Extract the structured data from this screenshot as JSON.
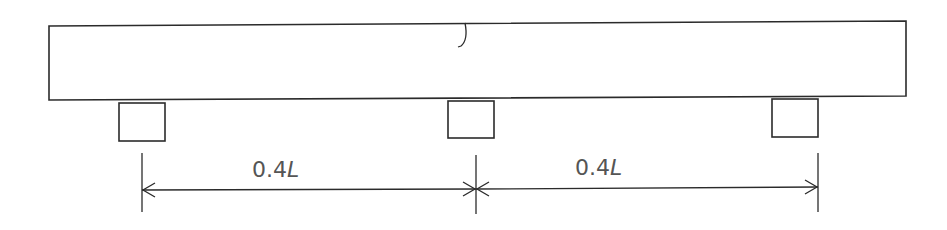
{
  "diagram": {
    "type": "beam-on-supports",
    "colors": {
      "line": "#2b2b2b",
      "text": "#555555",
      "background": "#ffffff"
    },
    "beam": {
      "x1": 49,
      "y1": 25,
      "x2": 906,
      "y2": 100
    },
    "mark": {
      "x": 462,
      "y_top": 23,
      "y_bottom": 46
    },
    "supports": [
      {
        "name": "left",
        "x": 119,
        "y": 103,
        "w": 46,
        "h": 38
      },
      {
        "name": "middle",
        "x": 448,
        "y": 101,
        "w": 46,
        "h": 37
      },
      {
        "name": "right",
        "x": 772,
        "y": 99,
        "w": 46,
        "h": 38
      }
    ],
    "dimensions": [
      {
        "label_num": "0.4",
        "label_var": "L",
        "x1": 142,
        "x2": 476,
        "y": 190
      },
      {
        "label_num": "0.4",
        "label_var": "L",
        "x1": 476,
        "x2": 818,
        "y": 189
      }
    ]
  }
}
